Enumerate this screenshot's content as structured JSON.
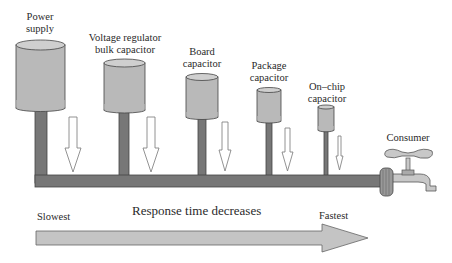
{
  "labels": {
    "power_supply": [
      "Power",
      "supply"
    ],
    "vrm": [
      "Voltage regulator",
      "bulk capacitor"
    ],
    "board": [
      "Board",
      "capacitor"
    ],
    "package": [
      "Package",
      "capacitor"
    ],
    "onchip": [
      "On–chip",
      "capacitor"
    ],
    "consumer": "Consumer"
  },
  "axis": {
    "slowest": "Slowest",
    "caption": "Response time decreases",
    "fastest": "Fastest"
  },
  "colors": {
    "capacitor_fill": "#b9b9b9",
    "capacitor_top": "#cfcfcf",
    "pipe": "#777777",
    "arrow_fill": "#c4c4c4",
    "outline": "#444444"
  }
}
